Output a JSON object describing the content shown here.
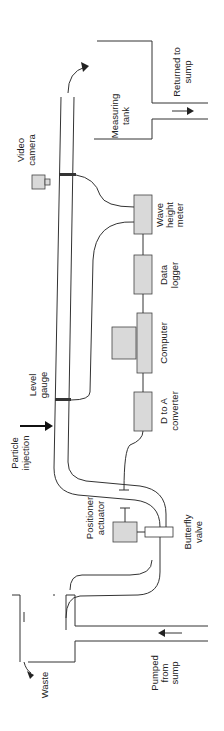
{
  "diagram": {
    "labels": {
      "measuring_tank": [
        "Measuring",
        "tank"
      ],
      "returned_to_sump": [
        "Returned to",
        "sump"
      ],
      "video_camera": [
        "Video",
        "camera"
      ],
      "wave_height_meter": [
        "Wave",
        "height",
        "meter"
      ],
      "data_logger": [
        "Data",
        "logger"
      ],
      "computer": [
        "Computer"
      ],
      "level_gauge": [
        "Level",
        "gauge"
      ],
      "d_to_a_converter": [
        "D to A",
        "converter"
      ],
      "particle_injection": [
        "Particle",
        "injection"
      ],
      "positioner_actuator": [
        "Positioner",
        "actuator"
      ],
      "butterfly_valve": [
        "Butterfly",
        "valve"
      ],
      "pumped_from_sump": [
        "Pumped",
        "from",
        "sump"
      ],
      "waste": [
        "Waste"
      ]
    },
    "colors": {
      "line": "#333333",
      "box_fill": "#d9d9d9"
    }
  }
}
